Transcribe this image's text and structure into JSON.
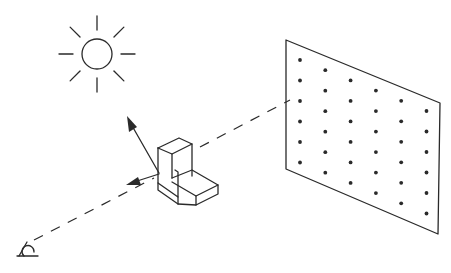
{
  "diagram": {
    "elements": {
      "light_source": {
        "icon": "sun-icon",
        "rays": 8
      },
      "object": {
        "icon": "l-bracket-block-icon"
      },
      "observer": {
        "icon": "eye-icon"
      },
      "screen": {
        "icon": "dot-grid-screen",
        "dot_columns": 6,
        "dot_rows_per_column": [
          6,
          6,
          6,
          6,
          6,
          6
        ]
      },
      "arrows": [
        {
          "name": "reflection-arrow",
          "direction": "up-left toward light source"
        },
        {
          "name": "view-arrow",
          "direction": "left toward observer"
        }
      ],
      "dashed_lines": [
        {
          "name": "observer-to-object-line"
        },
        {
          "name": "object-to-screen-line"
        }
      ]
    },
    "colors": {
      "ink": "#2a2a2a",
      "background": "#ffffff"
    }
  }
}
